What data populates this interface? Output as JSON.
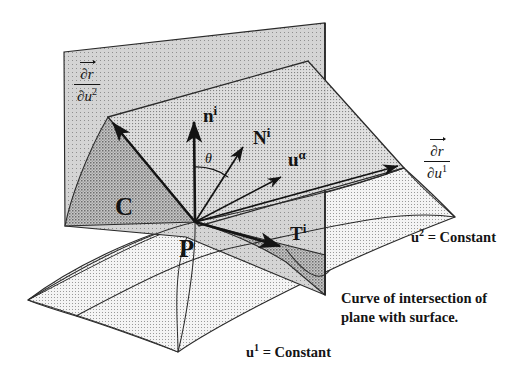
{
  "figure": {
    "title_alt": "Surface with tangent plane, normal vector and intersecting plane",
    "background": "#ffffff",
    "ink": "#141414",
    "fills": {
      "vertical_plane": "#d9d9d9",
      "tangent_plane": "#cfcfcf",
      "surface": "#eaeaea",
      "wedge_dark": "#b4b4b4",
      "wedge_mid": "#bdbdbd"
    }
  },
  "labels": {
    "partial_u2": {
      "numerator": "∂r",
      "denominator": "∂u",
      "den_sup": "2"
    },
    "partial_u1": {
      "numerator": "∂r",
      "denominator": "∂u",
      "den_sup": "1"
    },
    "normal_vector": {
      "base": "n",
      "sup": "i"
    },
    "principal_normal": {
      "base": "N",
      "sup": "i"
    },
    "surface_vector": {
      "base": "u",
      "sup": "α"
    },
    "tangent_vector": {
      "base": "T",
      "sup": "i"
    },
    "angle": "θ",
    "curve_label": "C",
    "point_label": "P",
    "u2_constant": {
      "base": "u",
      "sup": "2",
      "rest": "= Constant"
    },
    "u1_constant": {
      "base": "u",
      "sup": "1",
      "rest": "= Constant"
    },
    "caption_line1": "Curve of intersection of",
    "caption_line2": "plane with surface."
  },
  "geometry": {
    "point_P": [
      195,
      222
    ],
    "vectors": [
      {
        "name": "n-vector",
        "from": [
          195,
          222
        ],
        "to": [
          194,
          118
        ]
      },
      {
        "name": "N-vector",
        "from": [
          195,
          222
        ],
        "to": [
          246,
          143
        ]
      },
      {
        "name": "u-alpha-vector",
        "from": [
          195,
          222
        ],
        "to": [
          286,
          173
        ]
      },
      {
        "name": "T-vector",
        "from": [
          195,
          222
        ],
        "to": [
          286,
          249
        ]
      },
      {
        "name": "dr-du2-vector",
        "from": [
          195,
          222
        ],
        "to": [
          109,
          118
        ]
      },
      {
        "name": "dr-du1-vector",
        "from": [
          195,
          222
        ],
        "to": [
          404,
          168
        ]
      }
    ],
    "vertical_plane": [
      [
        64,
        52
      ],
      [
        325,
        23
      ],
      [
        325,
        295
      ],
      [
        186,
        237
      ],
      [
        65,
        226
      ]
    ],
    "tangent_plane": [
      [
        108,
        117
      ],
      [
        308,
        61
      ],
      [
        404,
        168
      ],
      [
        199,
        226
      ]
    ],
    "angle_arc_deg": {
      "start": 90,
      "end": 57
    }
  }
}
